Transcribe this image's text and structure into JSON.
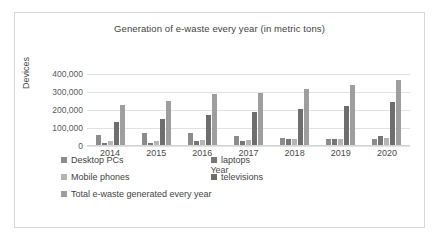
{
  "chart_data": {
    "type": "bar",
    "title": "Generation of e-waste every year (in metric tons)",
    "xlabel": "Year",
    "ylabel": "Devices",
    "categories": [
      "2014",
      "2015",
      "2016",
      "2017",
      "2018",
      "2019",
      "2020"
    ],
    "ylim": [
      0,
      400000
    ],
    "yticks": [
      "0",
      "100,000",
      "200,000",
      "300,000",
      "400,000"
    ],
    "ytick_values": [
      0,
      100000,
      200000,
      300000,
      400000
    ],
    "grid": true,
    "legend_position": "bottom",
    "series": [
      {
        "name": "Desktop PCs",
        "color": "#8c8c8c",
        "values": [
          58000,
          68000,
          68000,
          50000,
          40000,
          36000,
          36000
        ]
      },
      {
        "name": "laptops",
        "color": "#767676",
        "values": [
          10000,
          12000,
          20000,
          25000,
          34000,
          36000,
          50000
        ]
      },
      {
        "name": "Mobile phones",
        "color": "#b5b5b5",
        "values": [
          22000,
          24000,
          28000,
          31000,
          35000,
          36000,
          38000
        ]
      },
      {
        "name": "televisions",
        "color": "#6e6e6e",
        "values": [
          131000,
          146000,
          168000,
          184000,
          203000,
          222000,
          241000
        ]
      },
      {
        "name": "Total e-waste generated every year",
        "color": "#9e9e9e",
        "values": [
          224000,
          249000,
          285000,
          292000,
          313000,
          336000,
          368000
        ]
      }
    ]
  },
  "colors": {
    "border": "#d8d8d8",
    "gridline": "#e2e2e2",
    "text": "#3f3f3f",
    "background": "#ffffff"
  }
}
